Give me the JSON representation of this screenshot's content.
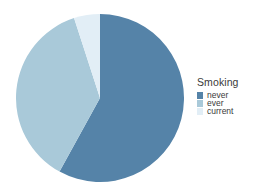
{
  "chart_data": {
    "type": "pie",
    "title": "",
    "legend_title": "Smoking",
    "legend_position": "right",
    "categories": [
      "never",
      "ever",
      "current"
    ],
    "values": [
      58,
      37,
      5
    ],
    "value_unit": "percent",
    "colors": [
      "#5583a8",
      "#a9c9d9",
      "#e2eef6"
    ],
    "xlabel": "",
    "ylabel": "",
    "grid": false,
    "slices": [
      {
        "label": "never",
        "value": 58,
        "color": "#5583a8",
        "start_angle": 0,
        "end_angle": 208.8
      },
      {
        "label": "ever",
        "value": 37,
        "color": "#a9c9d9",
        "start_angle": 208.8,
        "end_angle": 342.0
      },
      {
        "label": "current",
        "value": 5,
        "color": "#e2eef6",
        "start_angle": 342.0,
        "end_angle": 360
      }
    ]
  },
  "legend": {
    "title": "Smoking",
    "items": [
      {
        "label": "never",
        "color": "#5583a8"
      },
      {
        "label": "ever",
        "color": "#a9c9d9"
      },
      {
        "label": "current",
        "color": "#e2eef6"
      }
    ]
  },
  "geometry": {
    "center_x": 84,
    "center_y": 84,
    "radius": 84
  }
}
